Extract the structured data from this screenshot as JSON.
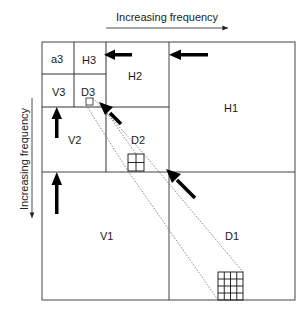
{
  "diagram": {
    "type": "wavelet-decomposition",
    "axis_labels": {
      "horizontal": "Increasing frequency",
      "vertical": "Increasing frequency"
    },
    "subbands": [
      {
        "id": "a3",
        "label": "a3"
      },
      {
        "id": "H3",
        "label": "H3"
      },
      {
        "id": "V3",
        "label": "V3"
      },
      {
        "id": "D3",
        "label": "D3"
      },
      {
        "id": "H2",
        "label": "H2"
      },
      {
        "id": "V2",
        "label": "V2"
      },
      {
        "id": "D2",
        "label": "D2"
      },
      {
        "id": "H1",
        "label": "H1"
      },
      {
        "id": "V1",
        "label": "V1"
      },
      {
        "id": "D1",
        "label": "D1"
      }
    ],
    "colors": {
      "line": "#333333",
      "arrow": "#000000",
      "background": "#ffffff"
    }
  }
}
